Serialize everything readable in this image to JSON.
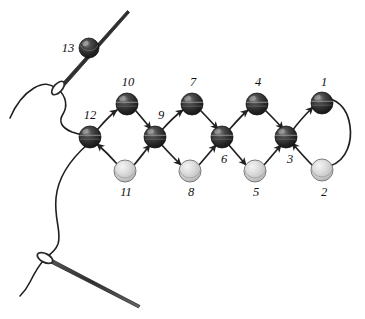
{
  "figure": {
    "canvas": {
      "width": 365,
      "height": 319
    },
    "background_color": "#ffffff",
    "thread_color": "#231f20",
    "dark_bead_color": "#2b2b2b",
    "light_bead_color": "#d0d0d0",
    "needle_color": "#3a3a3a"
  },
  "beads": [
    {
      "id": "bead-1",
      "label": "1",
      "type": "dark",
      "cx": 322,
      "cy": 103,
      "r": 11,
      "label_x": 324,
      "label_y": 86,
      "label_anchor": "middle"
    },
    {
      "id": "bead-2",
      "label": "2",
      "type": "light",
      "cx": 322,
      "cy": 170,
      "r": 11,
      "label_x": 324,
      "label_y": 196,
      "label_anchor": "middle"
    },
    {
      "id": "bead-3",
      "label": "3",
      "type": "dark",
      "cx": 286,
      "cy": 137,
      "r": 11,
      "label_x": 290,
      "label_y": 163,
      "label_anchor": "middle"
    },
    {
      "id": "bead-4",
      "label": "4",
      "type": "dark",
      "cx": 257,
      "cy": 104,
      "r": 11,
      "label_x": 258,
      "label_y": 86,
      "label_anchor": "middle"
    },
    {
      "id": "bead-5",
      "label": "5",
      "type": "light",
      "cx": 255,
      "cy": 171,
      "r": 11,
      "label_x": 256,
      "label_y": 196,
      "label_anchor": "middle"
    },
    {
      "id": "bead-6",
      "label": "6",
      "type": "dark",
      "cx": 222,
      "cy": 137,
      "r": 11,
      "label_x": 224,
      "label_y": 163,
      "label_anchor": "middle"
    },
    {
      "id": "bead-7",
      "label": "7",
      "type": "dark",
      "cx": 192,
      "cy": 104,
      "r": 11,
      "label_x": 193,
      "label_y": 86,
      "label_anchor": "middle"
    },
    {
      "id": "bead-8",
      "label": "8",
      "type": "light",
      "cx": 190,
      "cy": 171,
      "r": 11,
      "label_x": 191,
      "label_y": 196,
      "label_anchor": "middle"
    },
    {
      "id": "bead-9",
      "label": "9",
      "type": "dark",
      "cx": 155,
      "cy": 137,
      "r": 11,
      "label_x": 160,
      "label_y": 119,
      "label_anchor": "middle"
    },
    {
      "id": "bead-10",
      "label": "10",
      "type": "dark",
      "cx": 127,
      "cy": 104,
      "r": 11,
      "label_x": 128,
      "label_y": 86,
      "label_anchor": "middle"
    },
    {
      "id": "bead-11",
      "label": "11",
      "type": "light",
      "cx": 125,
      "cy": 171,
      "r": 11,
      "label_x": 126,
      "label_y": 196,
      "label_anchor": "middle"
    },
    {
      "id": "bead-12",
      "label": "12",
      "type": "dark",
      "cx": 90,
      "cy": 137,
      "r": 11,
      "label_x": 90,
      "label_y": 119,
      "label_anchor": "middle"
    },
    {
      "id": "bead-13",
      "label": "13",
      "type": "dark",
      "cx": 89,
      "cy": 48,
      "r": 10,
      "label_x": 68,
      "label_y": 52,
      "label_anchor": "middle"
    }
  ],
  "needles": [
    {
      "id": "needle-top",
      "eye_x": 57,
      "eye_y": 88,
      "tip_x": 128,
      "tip_y": 11
    },
    {
      "id": "needle-bottom",
      "eye_x": 45,
      "eye_y": 258,
      "tip_x": 140,
      "tip_y": 306
    }
  ],
  "legend": {
    "dark_bead_name": "dark-bead",
    "light_bead_name": "light-bead",
    "thread_name": "thread-path",
    "needle_name": "beading-needle"
  },
  "sequence_order": [
    "1",
    "2",
    "3",
    "4",
    "5",
    "6",
    "7",
    "8",
    "9",
    "10",
    "11",
    "12",
    "13"
  ]
}
